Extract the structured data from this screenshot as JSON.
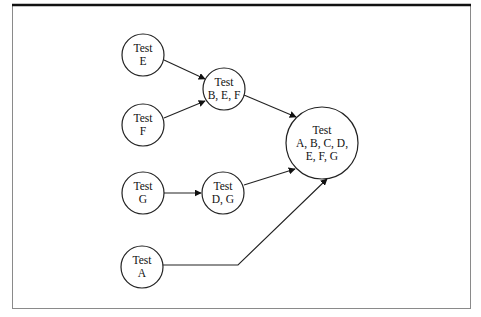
{
  "diagram": {
    "type": "flow-graph",
    "frame": {
      "border_color": "#888888",
      "top_rule_color": "#111111"
    },
    "nodes": [
      {
        "id": "E",
        "lines": [
          "Test",
          "E"
        ],
        "cx": 143,
        "cy": 55,
        "r": 21
      },
      {
        "id": "F",
        "lines": [
          "Test",
          "F"
        ],
        "cx": 143,
        "cy": 125,
        "r": 21
      },
      {
        "id": "BEF",
        "lines": [
          "Test",
          "B, E, F"
        ],
        "cx": 224,
        "cy": 89,
        "r": 21
      },
      {
        "id": "G",
        "lines": [
          "Test",
          "G"
        ],
        "cx": 143,
        "cy": 193,
        "r": 21
      },
      {
        "id": "DG",
        "lines": [
          "Test",
          "D, G"
        ],
        "cx": 223,
        "cy": 193,
        "r": 21
      },
      {
        "id": "A",
        "lines": [
          "Test",
          "A"
        ],
        "cx": 142,
        "cy": 267,
        "r": 21
      },
      {
        "id": "ALL",
        "lines": [
          "Test",
          "A, B, C, D,",
          "E, F, G"
        ],
        "cx": 322,
        "cy": 143,
        "r": 36
      }
    ],
    "edges": [
      {
        "from": "E",
        "to": "BEF",
        "points": [
          [
            164,
            60
          ],
          [
            205,
            79
          ]
        ]
      },
      {
        "from": "F",
        "to": "BEF",
        "points": [
          [
            164,
            118
          ],
          [
            205,
            101
          ]
        ]
      },
      {
        "from": "BEF",
        "to": "ALL",
        "points": [
          [
            244,
            95
          ],
          [
            296,
            117
          ]
        ]
      },
      {
        "from": "G",
        "to": "DG",
        "points": [
          [
            164,
            193
          ],
          [
            201,
            193
          ]
        ]
      },
      {
        "from": "DG",
        "to": "ALL",
        "points": [
          [
            244,
            185
          ],
          [
            295,
            169
          ]
        ]
      },
      {
        "from": "A",
        "to": "ALL",
        "points": [
          [
            163,
            265
          ],
          [
            238,
            265
          ],
          [
            327,
            179
          ]
        ]
      }
    ]
  }
}
